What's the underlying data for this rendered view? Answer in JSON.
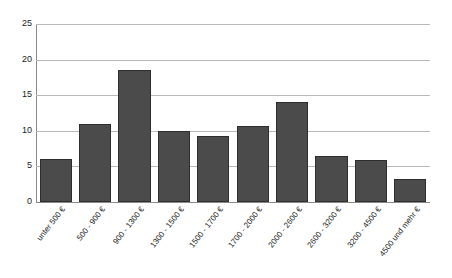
{
  "chart_data": {
    "type": "bar",
    "title": "",
    "subtitle": "",
    "xlabel": "",
    "ylabel": "",
    "ylim": [
      0,
      25
    ],
    "y_ticks": [
      0,
      5,
      10,
      15,
      20,
      25
    ],
    "grid": true,
    "legend": false,
    "legend_position": "none",
    "bar_color": "#4b4b4b",
    "bar_edge_color": "#2e2e2e",
    "gridline_color": "#b9b9b9",
    "axis_color": "#8a8a8a",
    "background_color": "#ffffff",
    "categories": [
      "unter 500 €",
      "500 - 900 €",
      "900 - 1300 €",
      "1300 - 1500 €",
      "1500 - 1700 €",
      "1700 - 2000 €",
      "2000 - 2600 €",
      "2600 - 3200 €",
      "3200 - 4500 €",
      "4500 und mehr €"
    ],
    "values": [
      6.0,
      11.0,
      18.6,
      10.0,
      9.3,
      10.7,
      14.1,
      6.4,
      5.9,
      3.3
    ]
  }
}
